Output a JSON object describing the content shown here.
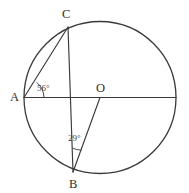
{
  "figure": {
    "type": "circle-geometry-diagram",
    "background_color": "#ffffff",
    "stroke_color": "#3a3a3a",
    "text_color": "#2e2e2e"
  },
  "circle": {
    "name": "main-circle",
    "center_label": "O",
    "center_x": 100,
    "center_y": 97.5,
    "radius": 76
  },
  "points": {
    "A": {
      "label": "A",
      "x": 24,
      "y": 97.5
    },
    "B": {
      "label": "B",
      "x": 73,
      "y": 172
    },
    "C": {
      "label": "C",
      "x": 68,
      "y": 27
    },
    "O": {
      "label": "O",
      "x": 100,
      "y": 97.5
    },
    "D": {
      "label": "",
      "x": 176,
      "y": 97.5
    }
  },
  "segments": [
    {
      "name": "chord-AC",
      "from": "A",
      "to": "C"
    },
    {
      "name": "diameter-AD",
      "from": "A",
      "to": "D"
    },
    {
      "name": "chord-CB",
      "from": "C",
      "to": "B"
    },
    {
      "name": "radius-BO",
      "from": "B",
      "to": "O"
    }
  ],
  "angles": [
    {
      "name": "angle-at-A",
      "vertex": "A",
      "label": "56°",
      "value": 56,
      "between": [
        "AC",
        "AO"
      ]
    },
    {
      "name": "angle-at-B",
      "vertex": "B",
      "label": "29°",
      "value": 29,
      "between": [
        "BC",
        "BO"
      ]
    }
  ]
}
